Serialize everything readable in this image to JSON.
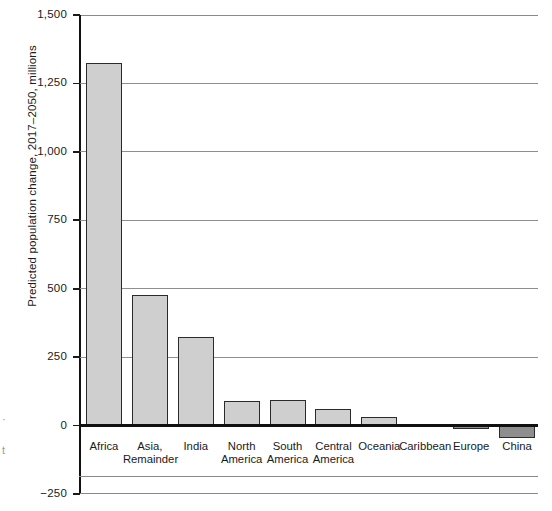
{
  "chart_data": {
    "type": "bar",
    "title": "",
    "subtitle": "",
    "xlabel": "",
    "ylabel": "Predicted population change, 2017–2050, millions",
    "ylim": [
      -250,
      1500
    ],
    "ytick_labels": [
      "1,500",
      "1,250",
      "1,000",
      "750",
      "500",
      "250",
      "0",
      "−250"
    ],
    "ytick_values": [
      1500,
      1250,
      1000,
      750,
      500,
      250,
      0,
      -250
    ],
    "grid": true,
    "gridlines_at": [
      1500,
      1250,
      1000,
      750,
      500,
      250
    ],
    "legend": "none",
    "categories": [
      "Africa",
      "Asia,\nRemainder",
      "India",
      "North\nAmerica",
      "South\nAmerica",
      "Central\nAmerica",
      "Oceania",
      "Caribbean",
      "Europe",
      "China"
    ],
    "values": [
      1325,
      478,
      325,
      88,
      95,
      62,
      30,
      6,
      -12,
      -45
    ],
    "bar_colors": [
      "#cfcfcf",
      "#cfcfcf",
      "#cfcfcf",
      "#cfcfcf",
      "#cfcfcf",
      "#cfcfcf",
      "#cfcfcf",
      "#cfcfcf",
      "#8e8e8e",
      "#8e8e8e"
    ],
    "bar_edge_color": "#2b2b2b",
    "axis_color": "#111111",
    "gridline_color": "#8f8f8f"
  },
  "edge_artifacts": [
    "·",
    "t"
  ]
}
